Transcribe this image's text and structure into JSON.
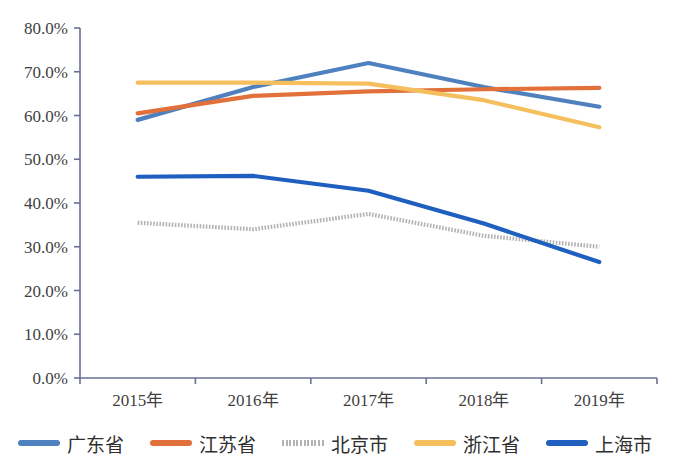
{
  "chart_data": {
    "type": "line",
    "title": "",
    "subtitle": "",
    "xlabel": "",
    "ylabel": "",
    "categories": [
      "2015年",
      "2016年",
      "2017年",
      "2018年",
      "2019年"
    ],
    "ylim": [
      0,
      80
    ],
    "y_tick_labels": [
      "0.0%",
      "10.0%",
      "20.0%",
      "30.0%",
      "40.0%",
      "50.0%",
      "60.0%",
      "70.0%",
      "80.0%"
    ],
    "y_tick_values": [
      0,
      10,
      20,
      30,
      40,
      50,
      60,
      70,
      80
    ],
    "grid": false,
    "legend_position": "bottom",
    "value_suffix": "%",
    "series": [
      {
        "name": "广东省",
        "color": "#4E81BD",
        "style": "solid",
        "values": [
          59.0,
          66.5,
          72.0,
          66.5,
          62.0
        ]
      },
      {
        "name": "江苏省",
        "color": "#E2703A",
        "style": "solid",
        "values": [
          60.5,
          64.5,
          65.5,
          66.0,
          66.3
        ]
      },
      {
        "name": "北京市",
        "color": "#B3B3B3",
        "style": "dotted",
        "values": [
          35.5,
          34.0,
          37.5,
          32.5,
          30.0
        ]
      },
      {
        "name": "浙江省",
        "color": "#F6BF5E",
        "style": "solid",
        "values": [
          67.5,
          67.5,
          67.3,
          63.5,
          57.3
        ]
      },
      {
        "name": "上海市",
        "color": "#1F5FBF",
        "style": "solid",
        "values": [
          46.0,
          46.2,
          42.8,
          35.3,
          26.5
        ]
      }
    ]
  },
  "legend": {
    "items": [
      {
        "label": "广东省"
      },
      {
        "label": "江苏省"
      },
      {
        "label": "北京市"
      },
      {
        "label": "浙江省"
      },
      {
        "label": "上海市"
      }
    ]
  },
  "axes": {
    "y_labels": [
      "80.0%",
      "70.0%",
      "60.0%",
      "50.0%",
      "40.0%",
      "30.0%",
      "20.0%",
      "10.0%",
      "0.0%"
    ],
    "x_labels": [
      "2015年",
      "2016年",
      "2017年",
      "2018年",
      "2019年"
    ]
  }
}
